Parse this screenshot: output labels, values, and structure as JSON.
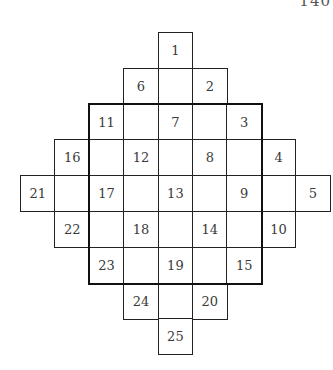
{
  "page": {
    "page_number": "140"
  },
  "diagram": {
    "grid": {
      "origin_x": 20,
      "origin_y": 32,
      "cell_width": 34.4,
      "cell_height": 35.8,
      "columns": 9,
      "rows": 9
    },
    "thick_border": {
      "col_start": 2,
      "row_start": 2,
      "col_span": 5,
      "row_span": 5
    },
    "cells": [
      {
        "row": 0,
        "col": 4,
        "label": "1"
      },
      {
        "row": 1,
        "col": 3,
        "label": "6"
      },
      {
        "row": 1,
        "col": 4,
        "label": ""
      },
      {
        "row": 1,
        "col": 5,
        "label": "2"
      },
      {
        "row": 2,
        "col": 2,
        "label": "11"
      },
      {
        "row": 2,
        "col": 3,
        "label": ""
      },
      {
        "row": 2,
        "col": 4,
        "label": "7"
      },
      {
        "row": 2,
        "col": 5,
        "label": ""
      },
      {
        "row": 2,
        "col": 6,
        "label": "3"
      },
      {
        "row": 3,
        "col": 1,
        "label": "16"
      },
      {
        "row": 3,
        "col": 2,
        "label": ""
      },
      {
        "row": 3,
        "col": 3,
        "label": "12"
      },
      {
        "row": 3,
        "col": 4,
        "label": ""
      },
      {
        "row": 3,
        "col": 5,
        "label": "8"
      },
      {
        "row": 3,
        "col": 6,
        "label": ""
      },
      {
        "row": 3,
        "col": 7,
        "label": "4"
      },
      {
        "row": 4,
        "col": 0,
        "label": "21"
      },
      {
        "row": 4,
        "col": 1,
        "label": ""
      },
      {
        "row": 4,
        "col": 2,
        "label": "17"
      },
      {
        "row": 4,
        "col": 3,
        "label": ""
      },
      {
        "row": 4,
        "col": 4,
        "label": "13"
      },
      {
        "row": 4,
        "col": 5,
        "label": ""
      },
      {
        "row": 4,
        "col": 6,
        "label": "9"
      },
      {
        "row": 4,
        "col": 7,
        "label": ""
      },
      {
        "row": 4,
        "col": 8,
        "label": "5"
      },
      {
        "row": 5,
        "col": 1,
        "label": "22"
      },
      {
        "row": 5,
        "col": 2,
        "label": ""
      },
      {
        "row": 5,
        "col": 3,
        "label": "18"
      },
      {
        "row": 5,
        "col": 4,
        "label": ""
      },
      {
        "row": 5,
        "col": 5,
        "label": "14"
      },
      {
        "row": 5,
        "col": 6,
        "label": ""
      },
      {
        "row": 5,
        "col": 7,
        "label": "10"
      },
      {
        "row": 6,
        "col": 2,
        "label": "23"
      },
      {
        "row": 6,
        "col": 3,
        "label": ""
      },
      {
        "row": 6,
        "col": 4,
        "label": "19"
      },
      {
        "row": 6,
        "col": 5,
        "label": ""
      },
      {
        "row": 6,
        "col": 6,
        "label": "15"
      },
      {
        "row": 7,
        "col": 3,
        "label": "24"
      },
      {
        "row": 7,
        "col": 4,
        "label": ""
      },
      {
        "row": 7,
        "col": 5,
        "label": "20"
      },
      {
        "row": 8,
        "col": 4,
        "label": "25"
      }
    ]
  }
}
